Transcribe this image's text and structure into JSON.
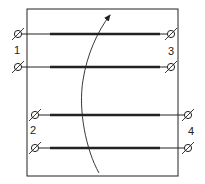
{
  "diagram": {
    "colors": {
      "stroke": "#222222",
      "background": "#ffffff"
    },
    "frame": {
      "x": 27,
      "y": 9,
      "w": 151,
      "h": 167
    },
    "terminals": [
      {
        "id": "1",
        "label": "1",
        "label_pos": [
          17,
          54
        ],
        "pins": [
          [
            18,
            34
          ],
          [
            18,
            67
          ]
        ]
      },
      {
        "id": "3",
        "label": "3",
        "label_pos": [
          171,
          55
        ],
        "pins": [
          [
            171,
            34
          ],
          [
            171,
            67
          ]
        ]
      },
      {
        "id": "2",
        "label": "2",
        "label_pos": [
          33,
          134
        ],
        "pins": [
          [
            35,
            115
          ],
          [
            35,
            148
          ]
        ]
      },
      {
        "id": "4",
        "label": "4",
        "label_pos": [
          191,
          135
        ],
        "pins": [
          [
            188,
            115
          ],
          [
            188,
            148
          ]
        ]
      }
    ],
    "conductors": [
      {
        "y": 34,
        "x1": 18,
        "x2": 171,
        "thick_from": 50,
        "thick_to": 160
      },
      {
        "y": 67,
        "x1": 18,
        "x2": 171,
        "thick_from": 50,
        "thick_to": 160
      },
      {
        "y": 115,
        "x1": 35,
        "x2": 188,
        "thick_from": 50,
        "thick_to": 160
      },
      {
        "y": 148,
        "x1": 35,
        "x2": 188,
        "thick_from": 50,
        "thick_to": 160
      }
    ],
    "arrow": {
      "name": "coupling-arrow",
      "path": "M99,173 C86,150 78,110 83,80 C87,55 97,32 110,15",
      "tip": [
        110,
        15
      ]
    }
  }
}
